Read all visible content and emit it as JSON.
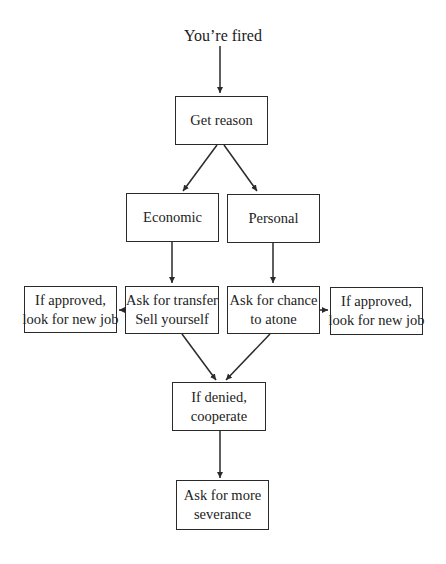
{
  "diagram": {
    "type": "flowchart",
    "start": "You’re fired",
    "nodes": [
      {
        "id": "get_reason",
        "lines": [
          "Get reason"
        ]
      },
      {
        "id": "economic",
        "lines": [
          "Economic"
        ]
      },
      {
        "id": "personal",
        "lines": [
          "Personal"
        ]
      },
      {
        "id": "approved_left",
        "lines": [
          "If approved,",
          "look for new job"
        ]
      },
      {
        "id": "transfer",
        "lines": [
          "Ask for transfer",
          "Sell yourself"
        ]
      },
      {
        "id": "atone",
        "lines": [
          "Ask for chance",
          "to atone"
        ]
      },
      {
        "id": "approved_right",
        "lines": [
          "If approved,",
          "look for new job"
        ]
      },
      {
        "id": "denied",
        "lines": [
          "If denied,",
          "cooperate"
        ]
      },
      {
        "id": "severance",
        "lines": [
          "Ask for more",
          "severance"
        ]
      }
    ],
    "edges": [
      [
        "start",
        "get_reason"
      ],
      [
        "get_reason",
        "economic"
      ],
      [
        "get_reason",
        "personal"
      ],
      [
        "economic",
        "transfer"
      ],
      [
        "personal",
        "atone"
      ],
      [
        "transfer",
        "approved_left"
      ],
      [
        "atone",
        "approved_right"
      ],
      [
        "transfer",
        "denied"
      ],
      [
        "atone",
        "denied"
      ],
      [
        "denied",
        "severance"
      ]
    ],
    "colors": {
      "line": "#2a2a2a",
      "text": "#222222",
      "background": "#ffffff"
    }
  }
}
